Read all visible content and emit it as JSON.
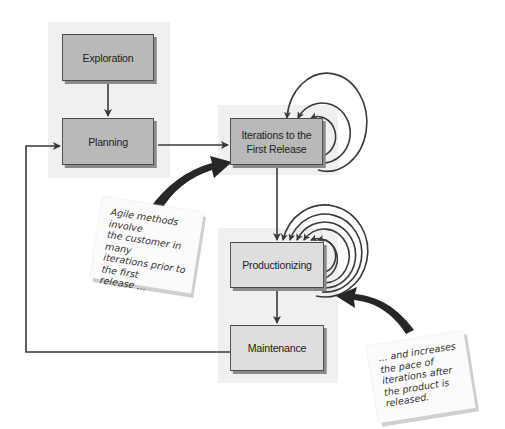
{
  "diagram": {
    "type": "flowchart",
    "nodes": {
      "exploration": "Exploration",
      "planning": "Planning",
      "iterations": "Iterations to the\nFirst Release",
      "productionizing": "Productionizing",
      "maintenance": "Maintenance"
    },
    "edges": [
      {
        "from": "Exploration",
        "to": "Planning"
      },
      {
        "from": "Planning",
        "to": "Iterations to the First Release"
      },
      {
        "from": "Iterations to the First Release",
        "to": "Iterations to the First Release",
        "loops": 3
      },
      {
        "from": "Iterations to the First Release",
        "to": "Productionizing"
      },
      {
        "from": "Productionizing",
        "to": "Productionizing",
        "loops": 6
      },
      {
        "from": "Productionizing",
        "to": "Maintenance"
      },
      {
        "from": "Maintenance",
        "to": "Planning"
      }
    ],
    "notes": {
      "note1": "Agile methods involve\nthe customer in many\niterations prior to\nthe first\nrelease ...",
      "note2": "... and increases\nthe pace of\niterations after\nthe product is\nreleased."
    },
    "colors": {
      "box_dark": "#b9b9b9",
      "box_light": "#dedede",
      "panel": "#f0f0f0",
      "line": "#3a3a3a"
    }
  }
}
